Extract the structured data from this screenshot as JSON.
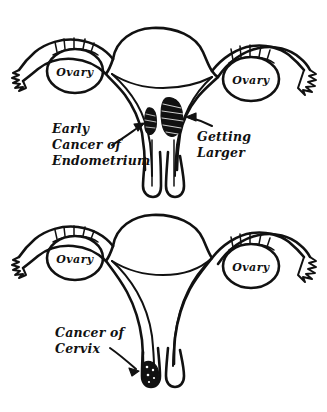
{
  "figure": {
    "style": "hand-drawn black ink line art on white background",
    "background_color": "#ffffff",
    "ink_color": "#111111",
    "panels": [
      {
        "id": "upper-panel",
        "name": "endometrial-cancer-panel",
        "description": "Frontal cut-away view of uterus, fallopian tubes and ovaries showing endometrial cancer at two stages inside the uterine cavity",
        "organ_labels": [
          {
            "text": "Ovary",
            "side": "left"
          },
          {
            "text": "Ovary",
            "side": "right"
          }
        ],
        "callouts": [
          {
            "name": "early-cancer-callout",
            "lines": [
              "Early",
              "Cancer of",
              "Endometrium"
            ],
            "arrow": "points up-right toward small tumor mass on left wall of uterine cavity"
          },
          {
            "name": "getting-larger-callout",
            "lines": [
              "Getting",
              "Larger"
            ],
            "arrow": "points left toward larger tumor mass on right side of uterine cavity"
          }
        ],
        "tumors": [
          {
            "name": "early-endometrial-tumor",
            "size": "small",
            "shading": "cross-hatched dark mass"
          },
          {
            "name": "enlarged-endometrial-tumor",
            "size": "larger",
            "shading": "cross-hatched dark mass"
          }
        ]
      },
      {
        "id": "lower-panel",
        "name": "cervical-cancer-panel",
        "description": "Frontal cut-away view of uterus, fallopian tubes and ovaries with an empty cavity and a dark tumor at the cervix",
        "organ_labels": [
          {
            "text": "Ovary",
            "side": "left"
          },
          {
            "text": "Ovary",
            "side": "right"
          }
        ],
        "callouts": [
          {
            "name": "cancer-of-cervix-callout",
            "lines": [
              "Cancer of",
              "Cervix"
            ],
            "arrow": "points down-right toward dark stippled mass at the cervix tip"
          }
        ],
        "tumors": [
          {
            "name": "cervical-tumor",
            "size": "nodular",
            "shading": "solid stippled dark blob"
          }
        ]
      }
    ]
  }
}
